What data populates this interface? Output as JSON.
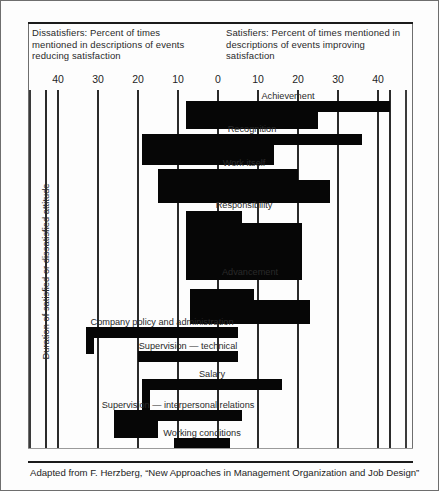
{
  "header": {
    "left": "Dissatisfiers: Percent of times mentioned in descriptions of events reducing satisfaction",
    "right": "Satisfiers: Percent of times mentioned in descriptions of events improving satisfaction"
  },
  "yaxis_caption": "Duration of satisfied or dissatisfied attitude",
  "footer": "Adapted from F. Herzberg,  “New Approaches in Management Organization and Job Design”",
  "colors": {
    "bar": "#060606",
    "gridline": "#2b2b2b",
    "frame": "#6e6e6e",
    "text": "#2a2a2a",
    "background": "#fdfdfd"
  },
  "chart_data": {
    "type": "bar",
    "orientation": "horizontal-diverging",
    "xlabel": "Percent of times mentioned",
    "ylabel": "Duration of satisfied or dissatisfied attitude",
    "xlim": [
      -50,
      50
    ],
    "grid": true,
    "legend": "none",
    "tick_labels": [
      "40",
      "30",
      "20",
      "10",
      "0",
      "10",
      "20",
      "30",
      "40"
    ],
    "tick_values": [
      -40,
      -30,
      -20,
      -10,
      0,
      10,
      20,
      30,
      40
    ],
    "note": "Each factor has two stacked bars: a short-duration bar (thin) and a long-duration bar (thick). Negative values extend left (dissatisfiers), positive right (satisfiers).",
    "categories": [
      "Achievement",
      "Recognition",
      "Work itself",
      "Responsibility",
      "Advancement",
      "Company policy and administration",
      "Supervision — technical",
      "Salary",
      "Supervision — interpersonal relations",
      "Working conditions"
    ],
    "series": [
      {
        "name": "Short duration",
        "values": [
          41,
          33,
          20,
          6,
          9,
          -4,
          -3,
          11,
          -6,
          -4
        ]
      },
      {
        "name": "Long duration",
        "values": [
          25,
          14,
          28,
          21,
          23,
          -31,
          -20,
          -17,
          -15,
          -14
        ]
      }
    ],
    "bars": [
      {
        "label": "Achievement",
        "left": -8,
        "right": 43,
        "short_right": 43,
        "long_right": 25,
        "row": 1
      },
      {
        "label": "Recognition",
        "left": -19,
        "right": 36,
        "short_right": 36,
        "long_right": 14,
        "row": 2
      },
      {
        "label": "Work itself",
        "left": -15,
        "right": 28,
        "short_right": 20,
        "long_right": 28,
        "row": 3
      },
      {
        "label": "Responsibility",
        "left": -8,
        "right": 21,
        "short_right": 6,
        "long_right": 21,
        "row": 4
      },
      {
        "label": "Advancement",
        "left": -7,
        "right": 23,
        "short_right": 9,
        "long_right": 23,
        "row": 5
      },
      {
        "label": "Company policy and administration",
        "left": -33,
        "right": 5,
        "short_right": 5,
        "long_right": -31,
        "row": 6
      },
      {
        "label": "Supervision — technical",
        "left": -20,
        "right": 5,
        "short_right": 5,
        "long_right": -20,
        "row": 7
      },
      {
        "label": "Salary",
        "left": -19,
        "right": 16,
        "short_right": 16,
        "long_right": -17,
        "row": 8
      },
      {
        "label": "Supervision — interpersonal relations",
        "left": -26,
        "right": 6,
        "short_right": 6,
        "long_right": -15,
        "row": 9
      },
      {
        "label": "Working conditions",
        "left": -11,
        "right": 3,
        "short_right": 3,
        "long_right": -11,
        "row": 10
      }
    ]
  }
}
